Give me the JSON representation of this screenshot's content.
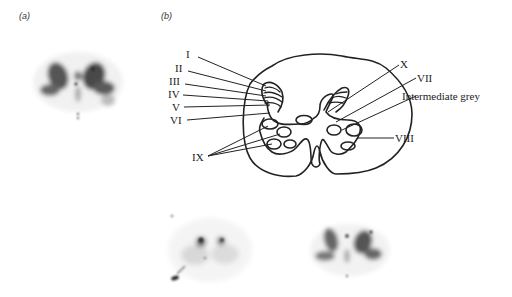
{
  "panels": {
    "a": {
      "label": "(a)",
      "description": "autoradiograph, spinal cord section"
    },
    "b": {
      "label": "(b)",
      "description": "schematic of spinal cord laminae"
    },
    "c": {
      "description": "autoradiograph, spinal cord section"
    },
    "d": {
      "description": "autoradiograph, spinal cord section"
    }
  },
  "diagram": {
    "left_labels": [
      "I",
      "II",
      "III",
      "IV",
      "V",
      "VI",
      "IX"
    ],
    "right_labels": [
      "X",
      "VII",
      "Intermediate grey",
      "VIII"
    ]
  },
  "colors": {
    "ink": "#222222",
    "background": "#ffffff",
    "stain": "#3a3a3a"
  }
}
